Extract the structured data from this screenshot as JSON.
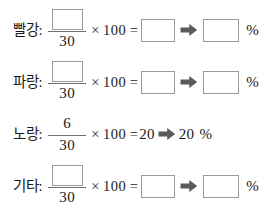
{
  "worksheet": {
    "denominator": "30",
    "multiplier_symbol": "×",
    "multiplier": "100",
    "equals_symbol": "=",
    "percent_symbol": "%",
    "arrow_icon": "right-arrow-icon",
    "box_border_color": "#9a9a9a",
    "arrow_color": "#5a5a5a",
    "text_color": "#1a1a1a",
    "rows": [
      {
        "label": "빨강:",
        "numerator": "",
        "numerator_filled": false,
        "result": "",
        "result_filled": false,
        "percent_value": "",
        "percent_filled": false
      },
      {
        "label": "파랑:",
        "numerator": "",
        "numerator_filled": false,
        "result": "",
        "result_filled": false,
        "percent_value": "",
        "percent_filled": false
      },
      {
        "label": "노랑:",
        "numerator": "6",
        "numerator_filled": true,
        "result": "20",
        "result_filled": true,
        "percent_value": "20",
        "percent_filled": true
      },
      {
        "label": "기타:",
        "numerator": "",
        "numerator_filled": false,
        "result": "",
        "result_filled": false,
        "percent_value": "",
        "percent_filled": false
      }
    ]
  }
}
